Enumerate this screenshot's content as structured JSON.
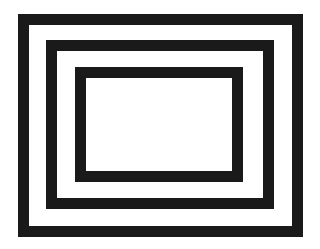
{
  "figure": {
    "frames": [
      {
        "name": "outer-rectangle",
        "color": "#1a1a1a"
      },
      {
        "name": "middle-rectangle",
        "color": "#1a1a1a"
      },
      {
        "name": "inner-rectangle",
        "color": "#1a1a1a"
      }
    ],
    "background": "#ffffff"
  }
}
